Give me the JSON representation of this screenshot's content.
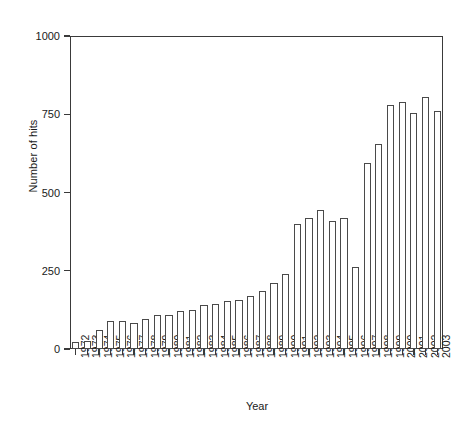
{
  "chart_data": {
    "type": "bar",
    "title": "",
    "xlabel": "Year",
    "ylabel": "Number of hits",
    "ylim": [
      0,
      1000
    ],
    "yticks": [
      0,
      250,
      500,
      750,
      1000
    ],
    "ytick_labels": [
      "0",
      "250",
      "500",
      "750",
      "1000"
    ],
    "grid": false,
    "legend": null,
    "bar_facecolor": "#ffffff",
    "bar_edgecolor": "#4a4a4a",
    "axis_color": "#3a3a3a",
    "categories": [
      "1972",
      "1973",
      "1974",
      "1975",
      "1976",
      "1977",
      "1978",
      "1979",
      "1980",
      "1981",
      "1982",
      "1983",
      "1984",
      "1985",
      "1986",
      "1987",
      "1988",
      "1989",
      "1990",
      "1991",
      "1992",
      "1993",
      "1994",
      "1995",
      "1996",
      "1997",
      "1998",
      "1999",
      "2000",
      "2001",
      "2002",
      "2003"
    ],
    "values": [
      22,
      24,
      62,
      88,
      88,
      82,
      96,
      110,
      108,
      122,
      126,
      140,
      145,
      152,
      155,
      170,
      185,
      210,
      240,
      400,
      420,
      445,
      410,
      420,
      262,
      595,
      655,
      780,
      790,
      755,
      805,
      760
    ]
  }
}
